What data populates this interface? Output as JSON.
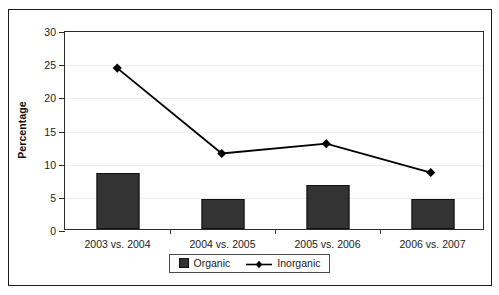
{
  "chart_data": {
    "type": "bar",
    "title": "",
    "subtitle": "",
    "xlabel": "",
    "ylabel": "Percentage",
    "categories": [
      "2003 vs. 2004",
      "2004 vs. 2005",
      "2005 vs. 2006",
      "2006 vs. 2007"
    ],
    "ylim": [
      0,
      30
    ],
    "yticks": [
      0,
      5,
      10,
      15,
      20,
      25,
      30
    ],
    "ytick_labels": [
      "0",
      "5",
      "10",
      "15",
      "20",
      "25",
      "30"
    ],
    "grid": "horizontal-light",
    "legend_position": "bottom-center",
    "series": [
      {
        "name": "Organic",
        "type": "bar",
        "color": "#333333",
        "marker": "square",
        "values": [
          8.5,
          4.6,
          6.7,
          4.6
        ]
      },
      {
        "name": "Inorganic",
        "type": "line",
        "color": "#000000",
        "marker": "diamond",
        "values": [
          24.5,
          11.5,
          13.0,
          8.6
        ]
      }
    ]
  },
  "legend": {
    "entries": [
      {
        "label": "Organic",
        "marker": "square-marker"
      },
      {
        "label": "Inorganic",
        "marker": "diamond-line-marker"
      }
    ]
  },
  "colors": {
    "bar_fill": "#333333",
    "line_stroke": "#000000",
    "frame": "#1a1a1a",
    "axis": "#2b2b2b",
    "gridline": "#efefef",
    "background": "#ffffff"
  }
}
